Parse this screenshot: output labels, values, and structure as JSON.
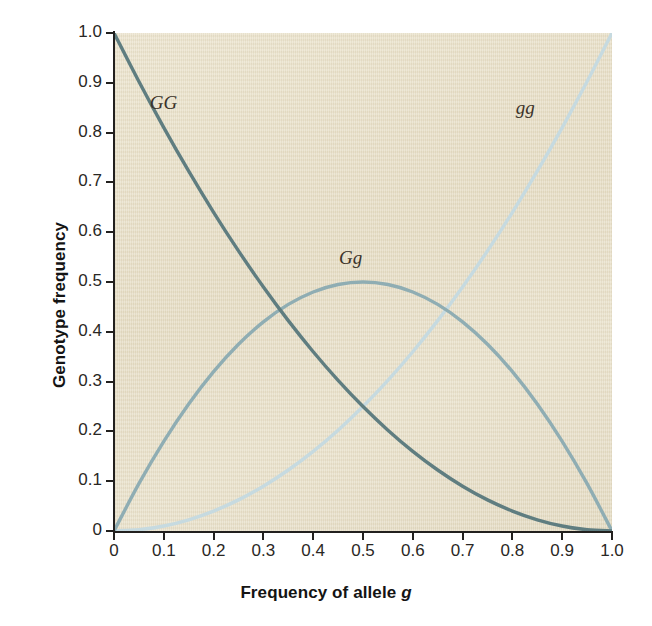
{
  "chart_data": {
    "type": "line",
    "title": "",
    "subtitle": "",
    "xlabel": "Frequency of allele g",
    "xlabel_plain": "Frequency of allele ",
    "xlabel_italic": "g",
    "ylabel": "Genotype frequency",
    "xlim": [
      0,
      1.0
    ],
    "ylim": [
      0,
      1.0
    ],
    "grid": false,
    "legend_position": "inline-annotations",
    "x_ticks": [
      "0",
      "0.1",
      "0.2",
      "0.3",
      "0.4",
      "0.5",
      "0.6",
      "0.7",
      "0.8",
      "0.9",
      "1.0"
    ],
    "x_tick_values": [
      0,
      0.1,
      0.2,
      0.3,
      0.4,
      0.5,
      0.6,
      0.7,
      0.8,
      0.9,
      1.0
    ],
    "y_ticks": [
      "0",
      "0.1",
      "0.2",
      "0.3",
      "0.4",
      "0.5",
      "0.6",
      "0.7",
      "0.8",
      "0.9",
      "1.0"
    ],
    "y_tick_values": [
      0,
      0.1,
      0.2,
      0.3,
      0.4,
      0.5,
      0.6,
      0.7,
      0.8,
      0.9,
      1.0
    ],
    "x": [
      0,
      0.05,
      0.1,
      0.15,
      0.2,
      0.25,
      0.3,
      0.35,
      0.4,
      0.45,
      0.5,
      0.55,
      0.6,
      0.65,
      0.7,
      0.75,
      0.8,
      0.85,
      0.9,
      0.95,
      1.0
    ],
    "series": [
      {
        "name": "GG",
        "label": "GG",
        "color": "#5f7d80",
        "formula": "(1-g)^2",
        "values": [
          1.0,
          0.9025,
          0.81,
          0.7225,
          0.64,
          0.5625,
          0.49,
          0.4225,
          0.36,
          0.3025,
          0.25,
          0.2025,
          0.16,
          0.1225,
          0.09,
          0.0625,
          0.04,
          0.0225,
          0.01,
          0.0025,
          0.0
        ],
        "label_x": 0.1,
        "label_y": 0.855
      },
      {
        "name": "Gg",
        "label": "Gg",
        "color": "#8fadb3",
        "formula": "2g(1-g)",
        "values": [
          0.0,
          0.095,
          0.18,
          0.255,
          0.32,
          0.375,
          0.42,
          0.455,
          0.48,
          0.495,
          0.5,
          0.495,
          0.48,
          0.455,
          0.42,
          0.375,
          0.32,
          0.255,
          0.18,
          0.095,
          0.0
        ],
        "label_x": 0.48,
        "label_y": 0.545
      },
      {
        "name": "gg",
        "label": "gg",
        "color": "#c6dae0",
        "formula": "g^2",
        "values": [
          0.0,
          0.0025,
          0.01,
          0.0225,
          0.04,
          0.0625,
          0.09,
          0.1225,
          0.16,
          0.2025,
          0.25,
          0.3025,
          0.36,
          0.4225,
          0.49,
          0.5625,
          0.64,
          0.7225,
          0.81,
          0.9025,
          1.0
        ],
        "label_x": 0.835,
        "label_y": 0.845
      }
    ],
    "annotations": [
      {
        "text": "GG",
        "note": "homozygous dominant curve label"
      },
      {
        "text": "Gg",
        "note": "heterozygous curve label"
      },
      {
        "text": "gg",
        "note": "homozygous recessive curve label"
      }
    ],
    "plot_background_color": "#e8dfc8",
    "axis_color": "#22201e",
    "figure_background_color": "#ffffff"
  }
}
